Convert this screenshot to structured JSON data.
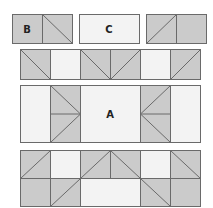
{
  "colors": {
    "dark": "#cbcbcb",
    "light": "#f3f3f3",
    "line": "#6a6a6a",
    "background": "#ffffff"
  },
  "labels": {
    "a": "A",
    "b": "B",
    "c": "C"
  },
  "legend_units": {
    "unit_b": {
      "label": "B",
      "description": "two dark squares, right one with diagonal"
    },
    "unit_c": {
      "label": "C",
      "description": "light rectangle"
    },
    "unit_third": {
      "description": "dark square with diagonal, plus plain dark square"
    }
  },
  "rows": [
    {
      "name": "row-2",
      "cells": [
        "dark-diag-down",
        "light",
        "dark-diag-down",
        "dark-diag-up-left",
        "light",
        "dark-diag-up"
      ]
    },
    {
      "name": "row-3",
      "cells": [
        "light",
        "dark-arrow-right",
        "light-A",
        "light-A",
        "dark-arrow-left",
        "light"
      ]
    },
    {
      "name": "row-4-top",
      "cells": [
        "dark-diag-up",
        "light",
        "dark-diag-up",
        "dark-diag-down",
        "light",
        "dark-diag-down"
      ]
    },
    {
      "name": "row-4-bottom",
      "cells": [
        "dark",
        "dark-diag-up",
        "light",
        "light",
        "dark-diag-down",
        "dark"
      ]
    }
  ]
}
